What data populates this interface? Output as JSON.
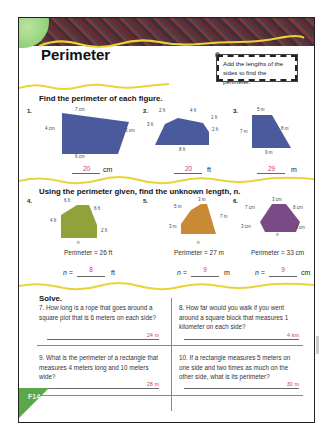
{
  "header": {
    "title": "Perimeter",
    "hint": "Add the lengths of the sides to find the perimeter."
  },
  "section1": {
    "title": "Find the perimeter of each figure.",
    "problems": [
      {
        "num": "1.",
        "labels": [
          "7 cm",
          "4 cm",
          "3 cm",
          "6 cm"
        ],
        "answer": "20",
        "unit": "cm",
        "color": "#4a5a9c"
      },
      {
        "num": "2.",
        "labels": [
          "2 ft",
          "4 ft",
          "1 ft",
          "3 ft",
          "2 ft",
          "8 ft"
        ],
        "answer": "20",
        "unit": "ft",
        "color": "#4a5a9c"
      },
      {
        "num": "3.",
        "labels": [
          "5 m",
          "7 m",
          "8 m",
          "9 m"
        ],
        "answer": "29",
        "unit": "m",
        "color": "#4a5a9c"
      }
    ]
  },
  "section2": {
    "title": "Using the perimeter given, find the unknown length, n.",
    "problems": [
      {
        "num": "4.",
        "labels": [
          "6 ft",
          "6 ft",
          "4 ft",
          "2 ft",
          "n"
        ],
        "perimeter": "Perimeter = 26 ft",
        "n_label": "n =",
        "answer": "8",
        "unit": "ft",
        "color": "#8fa33a"
      },
      {
        "num": "5.",
        "labels": [
          "3 m",
          "5 m",
          "7 m",
          "3 m",
          "n"
        ],
        "perimeter": "Perimeter = 27 m",
        "n_label": "n =",
        "answer": "9",
        "unit": "m",
        "color": "#c98a35"
      },
      {
        "num": "6.",
        "labels": [
          "3 cm",
          "7 cm",
          "8 cm",
          "3 cm",
          "3 cm",
          "n"
        ],
        "perimeter": "Perimeter = 33 cm",
        "n_label": "n =",
        "answer": "9",
        "unit": "cm",
        "color": "#7a4a86"
      }
    ]
  },
  "section3": {
    "title": "Solve.",
    "questions": [
      {
        "num": "7.",
        "text": "How long is a rope that goes around a square plot that is 6 meters on each side?",
        "answer": "24 m"
      },
      {
        "num": "8.",
        "text": "How far would you walk if you went around a square block that measures 1 kilometer on each side?",
        "answer": "4 km"
      },
      {
        "num": "9.",
        "text": "What is the perimeter of a rectangle that measures 4 meters long and 10 meters wide?",
        "answer": "28 m"
      },
      {
        "num": "10.",
        "text": "If a rectangle measures 5 meters on one side and two times as much on the other side, what is its perimeter?",
        "answer": "30 m"
      }
    ]
  },
  "footer": {
    "page_code": "F14"
  }
}
